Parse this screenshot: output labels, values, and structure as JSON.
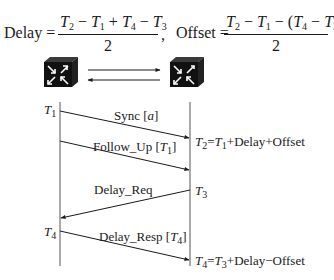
{
  "formulas": {
    "delay": {
      "label": "Delay =",
      "numerator": [
        "T2",
        "−",
        "T1",
        "+",
        "T4",
        "−",
        "T3"
      ],
      "denominator": "2",
      "separator": ","
    },
    "offset": {
      "label": "Offset =",
      "numerator": [
        "T2",
        "−",
        "T1",
        "−",
        "(",
        "T4",
        "−",
        "T3",
        ")"
      ],
      "denominator": "2"
    }
  },
  "devices": {
    "left": {
      "icon": "switch-icon",
      "role": "master"
    },
    "right": {
      "icon": "switch-icon",
      "role": "slave"
    },
    "link_arrows": [
      "right",
      "left"
    ]
  },
  "sequence": {
    "timestamps": {
      "t1": "T1",
      "t3": "T3",
      "t4": "T4"
    },
    "messages": [
      {
        "label": "Sync [a]",
        "direction": "left-to-right"
      },
      {
        "label": "Follow_Up [T1]",
        "direction": "left-to-right"
      },
      {
        "label": "Delay_Req",
        "direction": "right-to-left"
      },
      {
        "label": "Delay_Resp [T4]",
        "direction": "left-to-right"
      }
    ],
    "equations": {
      "t2": "T2 = T1 + Delay + Offset",
      "t4": "T4 = T3 + Delay − Offset"
    }
  },
  "colors": {
    "ink": "#1a1a1a",
    "switch_body": "#111111",
    "background": "#ffffff"
  }
}
